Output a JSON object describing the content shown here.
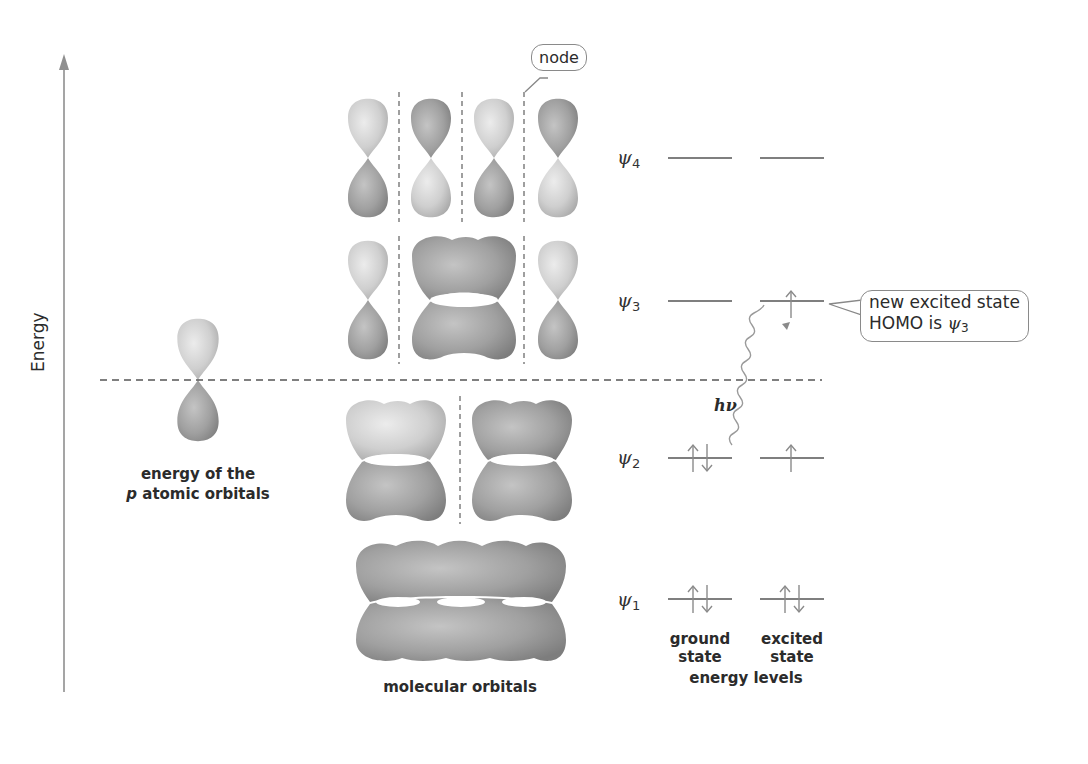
{
  "axis": {
    "label": "Energy",
    "color": "#8f8f8f"
  },
  "atomic": {
    "caption_line1": "energy of the",
    "caption_p": "p",
    "caption_line2_rest": " atomic orbitals"
  },
  "molecular": {
    "caption": "molecular orbitals",
    "levels": [
      {
        "id": "psi4",
        "nodes": 3,
        "lobe_groups": [
          1,
          1,
          1,
          1
        ]
      },
      {
        "id": "psi3",
        "nodes": 2,
        "lobe_groups": [
          1,
          2,
          1
        ]
      },
      {
        "id": "psi2",
        "nodes": 1,
        "lobe_groups": [
          2,
          2
        ]
      },
      {
        "id": "psi1",
        "nodes": 0,
        "lobe_groups": [
          4
        ]
      }
    ]
  },
  "callouts": {
    "node": "node",
    "excited_line1": "new excited state",
    "excited_line2_prefix": "HOMO is ",
    "excited_psi": "ψ",
    "excited_sub": "3"
  },
  "energy_levels": {
    "psi_symbol": "ψ",
    "labels": [
      {
        "sub": "4",
        "ground": "",
        "excited": ""
      },
      {
        "sub": "3",
        "ground": "",
        "excited": "↑"
      },
      {
        "sub": "2",
        "ground": "↑↓",
        "excited": "↑"
      },
      {
        "sub": "1",
        "ground": "↑↓",
        "excited": "↑↓"
      }
    ],
    "ground_caption_1": "ground",
    "ground_caption_2": "state",
    "excited_caption_1": "excited",
    "excited_caption_2": "state",
    "group_caption": "energy levels",
    "photon_label": "hν"
  },
  "colors": {
    "lobe_light": "#d4d4d4",
    "lobe_dark": "#9c9c9c",
    "line": "#555555",
    "dashed": "#555555",
    "arrow": "#8a8a8a"
  }
}
